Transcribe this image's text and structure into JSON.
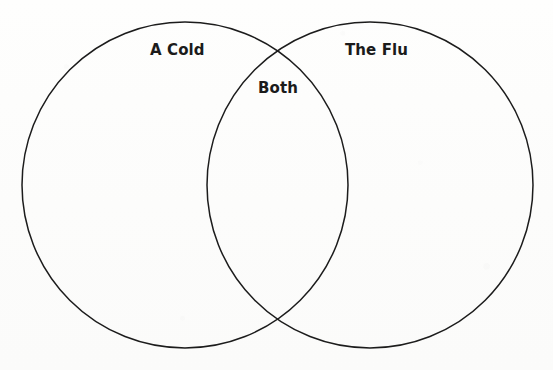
{
  "diagram": {
    "type": "venn",
    "set_count": 2,
    "background_color": "#fdfdfc",
    "stroke_color": "#1c1c1c",
    "stroke_width": 1.5,
    "label_color": "#1b1b1b",
    "left_circle": {
      "label": "A Cold",
      "center_x": 185,
      "center_y": 185,
      "radius": 163
    },
    "right_circle": {
      "label": "The Flu",
      "center_x": 370,
      "center_y": 185,
      "radius": 163
    },
    "intersection": {
      "label": "Both",
      "top_point_x": 278,
      "top_point_y": 47,
      "bottom_point_x": 278,
      "bottom_point_y": 323
    }
  }
}
